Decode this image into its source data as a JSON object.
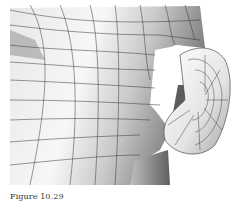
{
  "figure": {
    "caption": "Figure 10.29",
    "colors": {
      "background": "#ffffff",
      "mesh_line": "#333333",
      "shade_light": "#f2f2f2",
      "shade_mid": "#bdbdbd",
      "shade_dark": "#6e6e6e"
    }
  }
}
